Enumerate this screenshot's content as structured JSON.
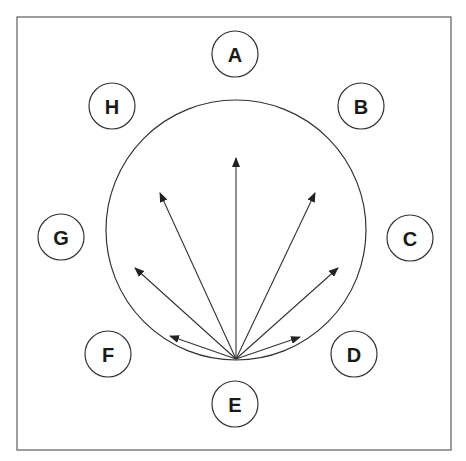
{
  "diagram": {
    "frame": {
      "x": 17,
      "y": 17,
      "width": 434,
      "height": 433
    },
    "big_circle": {
      "cx": 236,
      "cy": 230,
      "r": 130
    },
    "origin": {
      "x": 236,
      "y": 359
    },
    "nodes": [
      {
        "label": "A",
        "cx": 235,
        "cy": 54
      },
      {
        "label": "B",
        "cx": 361,
        "cy": 106
      },
      {
        "label": "C",
        "cx": 410,
        "cy": 238
      },
      {
        "label": "D",
        "cx": 354,
        "cy": 354
      },
      {
        "label": "E",
        "cx": 235,
        "cy": 404
      },
      {
        "label": "F",
        "cx": 108,
        "cy": 354
      },
      {
        "label": "G",
        "cx": 61,
        "cy": 237
      },
      {
        "label": "H",
        "cx": 112,
        "cy": 106
      }
    ],
    "node_radius": 23,
    "arrows": [
      {
        "to_x": 236,
        "to_y": 158
      },
      {
        "to_x": 160,
        "to_y": 193
      },
      {
        "to_x": 135,
        "to_y": 268
      },
      {
        "to_x": 170,
        "to_y": 336
      },
      {
        "to_x": 315,
        "to_y": 193
      },
      {
        "to_x": 338,
        "to_y": 268
      },
      {
        "to_x": 300,
        "to_y": 337
      }
    ],
    "colors": {
      "stroke": "#333333",
      "frame": "#6a6a6a",
      "background": "#ffffff"
    }
  }
}
